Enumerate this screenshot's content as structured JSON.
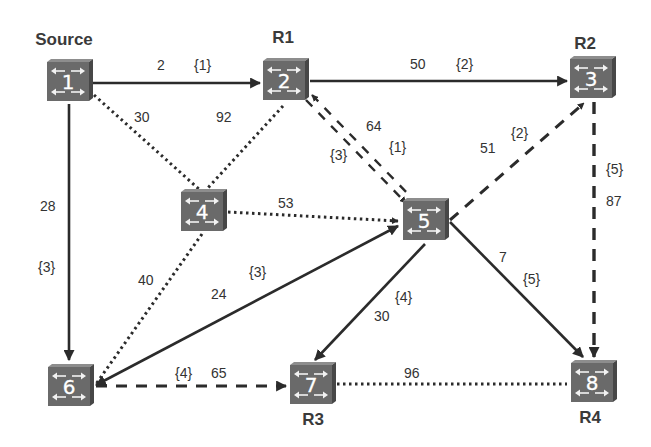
{
  "diagram": {
    "type": "network-graph",
    "colors": {
      "edge": "#2b2b2b",
      "node_fill": "#6e6e6e",
      "node_top": "#8a8a8a",
      "node_side": "#4a4a4a",
      "label": "#333333"
    },
    "nodes": [
      {
        "id": "1",
        "number": "1",
        "title": "Source",
        "x": 68,
        "y": 81
      },
      {
        "id": "2",
        "number": "2",
        "title": "R1",
        "x": 284,
        "y": 80
      },
      {
        "id": "3",
        "number": "3",
        "title": "R2",
        "x": 591,
        "y": 78
      },
      {
        "id": "4",
        "number": "4",
        "title": "",
        "x": 202,
        "y": 211
      },
      {
        "id": "5",
        "number": "5",
        "title": "",
        "x": 424,
        "y": 220
      },
      {
        "id": "6",
        "number": "6",
        "title": "",
        "x": 69,
        "y": 386
      },
      {
        "id": "7",
        "number": "7",
        "title": "R3",
        "x": 311,
        "y": 384
      },
      {
        "id": "8",
        "number": "8",
        "title": "R4",
        "x": 592,
        "y": 382
      }
    ],
    "edges": [
      {
        "from": "1",
        "to": "2",
        "style": "solid",
        "weight": "2",
        "tag": "{1}",
        "arrow": "end"
      },
      {
        "from": "2",
        "to": "3",
        "style": "solid",
        "weight": "50",
        "tag": "{2}",
        "arrow": "end"
      },
      {
        "from": "1",
        "to": "6",
        "style": "solid",
        "weight": "28",
        "tag": "{3}",
        "arrow": "end"
      },
      {
        "from": "1",
        "to": "4",
        "style": "dotted",
        "weight": "30",
        "tag": "",
        "arrow": "none"
      },
      {
        "from": "2",
        "to": "4",
        "style": "dotted",
        "weight": "92",
        "tag": "",
        "arrow": "none"
      },
      {
        "from": "2",
        "to": "5",
        "style": "double-dashed",
        "weight": "64",
        "tag_a": "{3}",
        "tag_b": "{1}",
        "arrow": "both"
      },
      {
        "from": "4",
        "to": "5",
        "style": "dotted",
        "weight": "53",
        "tag": "",
        "arrow": "end"
      },
      {
        "from": "5",
        "to": "3",
        "style": "dashed",
        "weight": "51",
        "tag": "{2}",
        "arrow": "end"
      },
      {
        "from": "3",
        "to": "8",
        "style": "dashed",
        "weight": "87",
        "tag": "{5}",
        "arrow": "end"
      },
      {
        "from": "4",
        "to": "6",
        "style": "dotted",
        "weight": "40",
        "tag": "",
        "arrow": "none"
      },
      {
        "from": "6",
        "to": "5",
        "style": "solid",
        "weight": "24",
        "tag": "{3}",
        "arrow": "both"
      },
      {
        "from": "5",
        "to": "7",
        "style": "solid",
        "weight": "30",
        "tag": "{4}",
        "arrow": "end"
      },
      {
        "from": "5",
        "to": "8",
        "style": "solid",
        "weight": "7",
        "tag": "{5}",
        "arrow": "end"
      },
      {
        "from": "6",
        "to": "7",
        "style": "dashed",
        "weight": "65",
        "tag": "{4}",
        "arrow": "end"
      },
      {
        "from": "7",
        "to": "8",
        "style": "dotted",
        "weight": "96",
        "tag": "",
        "arrow": "none"
      }
    ],
    "labels": {
      "e12_w": "2",
      "e12_t": "{1}",
      "e23_w": "50",
      "e23_t": "{2}",
      "e16_w": "28",
      "e16_t": "{3}",
      "e14_w": "30",
      "e24_w": "92",
      "e25_w": "64",
      "e25_ta": "{3}",
      "e25_tb": "{1}",
      "e45_w": "53",
      "e53_w": "51",
      "e53_t": "{2}",
      "e38_w": "87",
      "e38_t": "{5}",
      "e46_w": "40",
      "e65_w": "24",
      "e65_t": "{3}",
      "e57_w": "30",
      "e57_t": "{4}",
      "e58_w": "7",
      "e58_t": "{5}",
      "e67_w": "65",
      "e67_t": "{4}",
      "e78_w": "96"
    }
  }
}
